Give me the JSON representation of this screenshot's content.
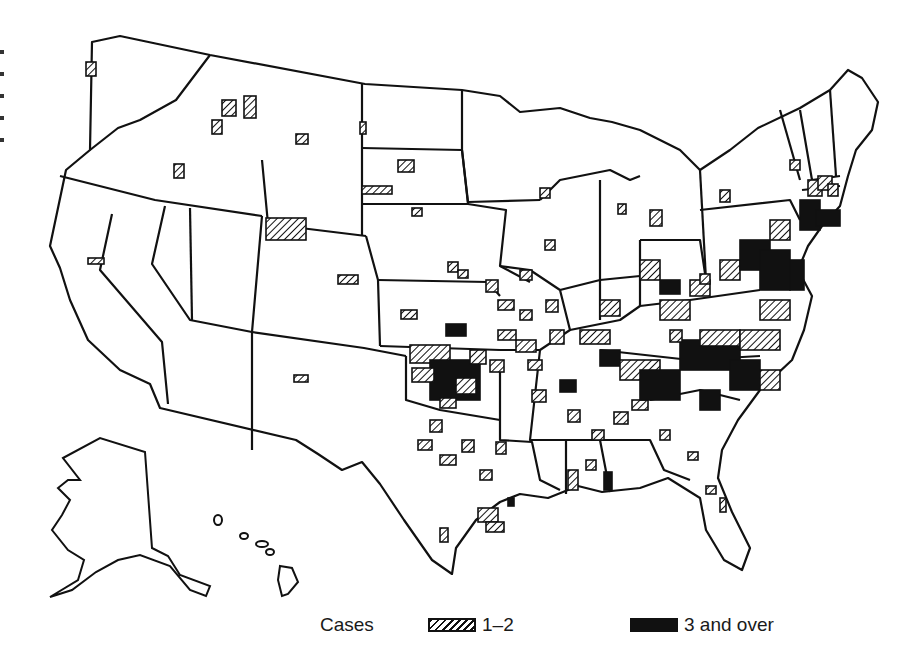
{
  "legend": {
    "title": "Cases",
    "items": [
      {
        "label": "1–2",
        "style": "hatched"
      },
      {
        "label": "3 and over",
        "style": "solid"
      }
    ]
  },
  "colors": {
    "ink": "#111111",
    "background": "#ffffff"
  },
  "chart_data": {
    "type": "choropleth-map",
    "region": "United States (counties)",
    "legend_title": "Cases",
    "categories": [
      "1–2",
      "3 and over"
    ],
    "fills": {
      "1–2": "hatched",
      "3 and over": "solid black"
    },
    "high_density_areas": [
      "Oklahoma",
      "North Carolina",
      "Virginia",
      "Maryland",
      "Tennessee",
      "South Carolina",
      "Arkansas",
      "Missouri",
      "New Jersey",
      "Long Island/Connecticut"
    ],
    "sparse_areas": [
      "Washington",
      "Idaho",
      "Montana",
      "Wyoming",
      "Colorado",
      "New Mexico",
      "California",
      "South Dakota",
      "North Dakota",
      "Nebraska",
      "Kansas"
    ]
  },
  "markers": [
    {
      "x": 86,
      "y": 62,
      "w": 10,
      "h": 14,
      "t": "h"
    },
    {
      "x": 222,
      "y": 100,
      "w": 14,
      "h": 16,
      "t": "h"
    },
    {
      "x": 212,
      "y": 120,
      "w": 10,
      "h": 14,
      "t": "h"
    },
    {
      "x": 244,
      "y": 96,
      "w": 12,
      "h": 22,
      "t": "h"
    },
    {
      "x": 296,
      "y": 134,
      "w": 12,
      "h": 10,
      "t": "h"
    },
    {
      "x": 174,
      "y": 164,
      "w": 10,
      "h": 14,
      "t": "h"
    },
    {
      "x": 266,
      "y": 218,
      "w": 40,
      "h": 22,
      "t": "h"
    },
    {
      "x": 88,
      "y": 258,
      "w": 16,
      "h": 6,
      "t": "h"
    },
    {
      "x": 360,
      "y": 122,
      "w": 6,
      "h": 12,
      "t": "h"
    },
    {
      "x": 398,
      "y": 160,
      "w": 16,
      "h": 12,
      "t": "h"
    },
    {
      "x": 362,
      "y": 186,
      "w": 30,
      "h": 8,
      "t": "h"
    },
    {
      "x": 412,
      "y": 208,
      "w": 10,
      "h": 8,
      "t": "h"
    },
    {
      "x": 338,
      "y": 275,
      "w": 20,
      "h": 9,
      "t": "h"
    },
    {
      "x": 294,
      "y": 375,
      "w": 14,
      "h": 7,
      "t": "h"
    },
    {
      "x": 401,
      "y": 310,
      "w": 16,
      "h": 9,
      "t": "h"
    },
    {
      "x": 446,
      "y": 324,
      "w": 20,
      "h": 12,
      "t": "s"
    },
    {
      "x": 448,
      "y": 262,
      "w": 10,
      "h": 10,
      "t": "h"
    },
    {
      "x": 458,
      "y": 270,
      "w": 10,
      "h": 8,
      "t": "h"
    },
    {
      "x": 486,
      "y": 280,
      "w": 12,
      "h": 12,
      "t": "h"
    },
    {
      "x": 498,
      "y": 300,
      "w": 16,
      "h": 10,
      "t": "h"
    },
    {
      "x": 410,
      "y": 345,
      "w": 40,
      "h": 18,
      "t": "h"
    },
    {
      "x": 430,
      "y": 360,
      "w": 50,
      "h": 40,
      "t": "s"
    },
    {
      "x": 412,
      "y": 368,
      "w": 22,
      "h": 14,
      "t": "h"
    },
    {
      "x": 456,
      "y": 378,
      "w": 20,
      "h": 16,
      "t": "h"
    },
    {
      "x": 440,
      "y": 398,
      "w": 16,
      "h": 10,
      "t": "h"
    },
    {
      "x": 470,
      "y": 350,
      "w": 16,
      "h": 14,
      "t": "h"
    },
    {
      "x": 490,
      "y": 360,
      "w": 14,
      "h": 12,
      "t": "h"
    },
    {
      "x": 498,
      "y": 330,
      "w": 18,
      "h": 10,
      "t": "h"
    },
    {
      "x": 516,
      "y": 340,
      "w": 20,
      "h": 12,
      "t": "h"
    },
    {
      "x": 528,
      "y": 360,
      "w": 14,
      "h": 10,
      "t": "h"
    },
    {
      "x": 532,
      "y": 390,
      "w": 14,
      "h": 12,
      "t": "h"
    },
    {
      "x": 550,
      "y": 330,
      "w": 14,
      "h": 14,
      "t": "h"
    },
    {
      "x": 560,
      "y": 380,
      "w": 16,
      "h": 12,
      "t": "s"
    },
    {
      "x": 520,
      "y": 310,
      "w": 12,
      "h": 10,
      "t": "h"
    },
    {
      "x": 546,
      "y": 300,
      "w": 12,
      "h": 12,
      "t": "h"
    },
    {
      "x": 430,
      "y": 420,
      "w": 12,
      "h": 12,
      "t": "h"
    },
    {
      "x": 418,
      "y": 440,
      "w": 14,
      "h": 10,
      "t": "h"
    },
    {
      "x": 440,
      "y": 455,
      "w": 16,
      "h": 10,
      "t": "h"
    },
    {
      "x": 462,
      "y": 440,
      "w": 12,
      "h": 12,
      "t": "h"
    },
    {
      "x": 496,
      "y": 442,
      "w": 10,
      "h": 12,
      "t": "h"
    },
    {
      "x": 480,
      "y": 470,
      "w": 12,
      "h": 10,
      "t": "h"
    },
    {
      "x": 440,
      "y": 528,
      "w": 8,
      "h": 14,
      "t": "h"
    },
    {
      "x": 478,
      "y": 508,
      "w": 20,
      "h": 14,
      "t": "h"
    },
    {
      "x": 486,
      "y": 522,
      "w": 18,
      "h": 10,
      "t": "h"
    },
    {
      "x": 508,
      "y": 498,
      "w": 6,
      "h": 8,
      "t": "s"
    },
    {
      "x": 568,
      "y": 410,
      "w": 12,
      "h": 12,
      "t": "h"
    },
    {
      "x": 592,
      "y": 430,
      "w": 12,
      "h": 10,
      "t": "h"
    },
    {
      "x": 586,
      "y": 460,
      "w": 10,
      "h": 10,
      "t": "h"
    },
    {
      "x": 568,
      "y": 470,
      "w": 10,
      "h": 20,
      "t": "h"
    },
    {
      "x": 604,
      "y": 472,
      "w": 8,
      "h": 18,
      "t": "s"
    },
    {
      "x": 614,
      "y": 412,
      "w": 14,
      "h": 12,
      "t": "h"
    },
    {
      "x": 632,
      "y": 400,
      "w": 16,
      "h": 10,
      "t": "h"
    },
    {
      "x": 660,
      "y": 430,
      "w": 10,
      "h": 10,
      "t": "h"
    },
    {
      "x": 688,
      "y": 452,
      "w": 10,
      "h": 8,
      "t": "h"
    },
    {
      "x": 706,
      "y": 486,
      "w": 10,
      "h": 8,
      "t": "h"
    },
    {
      "x": 720,
      "y": 498,
      "w": 6,
      "h": 14,
      "t": "h"
    },
    {
      "x": 580,
      "y": 330,
      "w": 30,
      "h": 14,
      "t": "h"
    },
    {
      "x": 600,
      "y": 350,
      "w": 20,
      "h": 16,
      "t": "s"
    },
    {
      "x": 620,
      "y": 360,
      "w": 40,
      "h": 20,
      "t": "h"
    },
    {
      "x": 640,
      "y": 370,
      "w": 40,
      "h": 30,
      "t": "s"
    },
    {
      "x": 680,
      "y": 340,
      "w": 60,
      "h": 30,
      "t": "s"
    },
    {
      "x": 700,
      "y": 330,
      "w": 40,
      "h": 16,
      "t": "h"
    },
    {
      "x": 730,
      "y": 360,
      "w": 30,
      "h": 30,
      "t": "s"
    },
    {
      "x": 700,
      "y": 390,
      "w": 20,
      "h": 20,
      "t": "s"
    },
    {
      "x": 740,
      "y": 330,
      "w": 40,
      "h": 20,
      "t": "h"
    },
    {
      "x": 760,
      "y": 370,
      "w": 20,
      "h": 20,
      "t": "h"
    },
    {
      "x": 660,
      "y": 300,
      "w": 30,
      "h": 20,
      "t": "h"
    },
    {
      "x": 600,
      "y": 300,
      "w": 20,
      "h": 16,
      "t": "h"
    },
    {
      "x": 640,
      "y": 260,
      "w": 20,
      "h": 20,
      "t": "h"
    },
    {
      "x": 660,
      "y": 280,
      "w": 20,
      "h": 14,
      "t": "s"
    },
    {
      "x": 690,
      "y": 280,
      "w": 20,
      "h": 16,
      "t": "h"
    },
    {
      "x": 720,
      "y": 260,
      "w": 20,
      "h": 20,
      "t": "h"
    },
    {
      "x": 740,
      "y": 240,
      "w": 30,
      "h": 30,
      "t": "s"
    },
    {
      "x": 760,
      "y": 250,
      "w": 30,
      "h": 40,
      "t": "s"
    },
    {
      "x": 770,
      "y": 220,
      "w": 20,
      "h": 20,
      "t": "h"
    },
    {
      "x": 760,
      "y": 300,
      "w": 30,
      "h": 20,
      "t": "h"
    },
    {
      "x": 790,
      "y": 260,
      "w": 14,
      "h": 30,
      "t": "s"
    },
    {
      "x": 800,
      "y": 200,
      "w": 20,
      "h": 30,
      "t": "s"
    },
    {
      "x": 816,
      "y": 210,
      "w": 24,
      "h": 16,
      "t": "s"
    },
    {
      "x": 808,
      "y": 180,
      "w": 14,
      "h": 16,
      "t": "h"
    },
    {
      "x": 818,
      "y": 176,
      "w": 14,
      "h": 14,
      "t": "h"
    },
    {
      "x": 828,
      "y": 184,
      "w": 10,
      "h": 12,
      "t": "h"
    },
    {
      "x": 790,
      "y": 160,
      "w": 10,
      "h": 10,
      "t": "h"
    },
    {
      "x": 720,
      "y": 190,
      "w": 10,
      "h": 12,
      "t": "h"
    },
    {
      "x": 650,
      "y": 210,
      "w": 12,
      "h": 16,
      "t": "h"
    },
    {
      "x": 618,
      "y": 204,
      "w": 8,
      "h": 10,
      "t": "h"
    },
    {
      "x": 545,
      "y": 240,
      "w": 10,
      "h": 10,
      "t": "h"
    },
    {
      "x": 540,
      "y": 188,
      "w": 10,
      "h": 10,
      "t": "h"
    },
    {
      "x": 700,
      "y": 274,
      "w": 10,
      "h": 10,
      "t": "h"
    },
    {
      "x": 670,
      "y": 330,
      "w": 12,
      "h": 12,
      "t": "h"
    },
    {
      "x": 520,
      "y": 270,
      "w": 12,
      "h": 10,
      "t": "h"
    }
  ]
}
